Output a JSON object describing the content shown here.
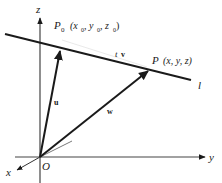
{
  "diagram": {
    "title": "",
    "axes": {
      "z_label": "z",
      "y_label": "y",
      "x_label": "x",
      "origin_label": "O"
    },
    "line": {
      "label": "l"
    },
    "points": {
      "p0": {
        "name": "P",
        "sub": "0",
        "coords_open": "(x",
        "coords_x_sub": "0",
        "coords_sep1": ", y",
        "coords_y_sub": "0",
        "coords_sep2": ", z",
        "coords_z_sub": "0",
        "coords_close": ")"
      },
      "p": {
        "name": "P",
        "coords": "(x, y, z)"
      }
    },
    "vectors": {
      "u": "u",
      "w": "w",
      "tv_t": "t",
      "tv_v": "v"
    },
    "colors": {
      "stroke": "#1a1a1a",
      "axis": "#444444",
      "background": "#ffffff"
    }
  }
}
